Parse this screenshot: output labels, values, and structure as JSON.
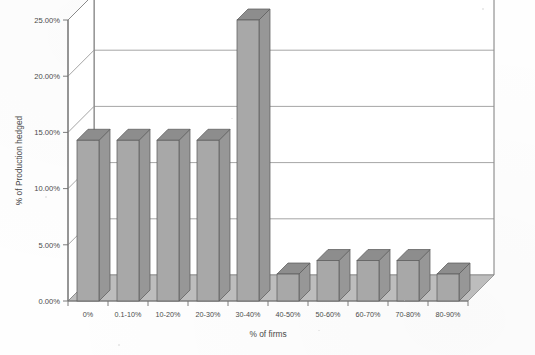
{
  "chart_data": {
    "type": "bar",
    "style": "3d-column",
    "title": "",
    "xlabel": "% of firms",
    "ylabel": "% of Production hedged",
    "categories": [
      "0%",
      "0.1-10%",
      "10-20%",
      "20-30%",
      "30-40%",
      "40-50%",
      "50-60%",
      "60-70%",
      "70-80%",
      "80-90%"
    ],
    "values": [
      14.3,
      14.3,
      14.3,
      14.3,
      25.0,
      2.4,
      3.6,
      3.6,
      3.6,
      2.4
    ],
    "ylim": [
      0,
      25
    ],
    "ytick_values": [
      0,
      5,
      10,
      15,
      20,
      25
    ],
    "ytick_labels": [
      "0.00%",
      "5.00%",
      "10.00%",
      "15.00%",
      "20.00%",
      "25.00%"
    ],
    "grid": true,
    "grid_axis": "y",
    "legend": false,
    "series": [
      {
        "name": "% of Production hedged",
        "values": [
          14.3,
          14.3,
          14.3,
          14.3,
          25.0,
          2.4,
          3.6,
          3.6,
          3.6,
          2.4
        ]
      }
    ],
    "colors": {
      "bar_front": "#a8a8a8",
      "bar_top": "#8d8d8d",
      "bar_side": "#979797",
      "bar_outline": "#5d5d5d",
      "floor": "#bdbdbd",
      "floor_outline": "#8a8a8a",
      "wall": "#ffffff",
      "gridline": "#8e8e8e",
      "axis": "#6e6e6e",
      "text": "#4a4a4a"
    }
  },
  "axes": {
    "y_title": "% of Production hedged",
    "x_title": "% of firms"
  }
}
